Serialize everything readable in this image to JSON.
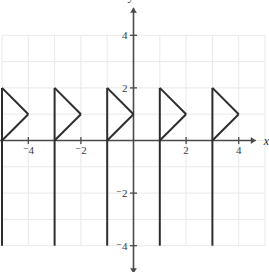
{
  "figure": {
    "kind": "coordinate-plane-graph",
    "background": "#ffffff",
    "grid_color": "#e9e9e9",
    "axis_color": "#4a4a4a",
    "curve_color": "#2e2e2e"
  },
  "axes": {
    "x_name": "x",
    "y_name": "y",
    "x_tick_labels": [
      "⁻4",
      "⁻2",
      "2",
      "4"
    ],
    "y_tick_labels": [
      "4",
      "2",
      "⁻2",
      "⁻4"
    ]
  },
  "chart_data": {
    "type": "line",
    "title": "",
    "xlabel": "x",
    "ylabel": "y",
    "xlim": [
      -5.85,
      4.65
    ],
    "ylim": [
      -5.05,
      5.05
    ],
    "grid": true,
    "legend": null,
    "x_ticks": [
      -4,
      -2,
      2,
      4
    ],
    "y_ticks": [
      4,
      2,
      -2,
      -4
    ],
    "x_tick_labels": [
      "⁻4",
      "⁻2",
      "2",
      "4"
    ],
    "y_tick_labels": [
      "4",
      "2",
      "⁻2",
      "⁻4"
    ],
    "period": 2,
    "period_starts": [
      -5,
      -3,
      -1,
      1,
      3
    ],
    "series": [
      {
        "name": "branch-1",
        "vertical": [
          [
            -5,
            2
          ],
          [
            -5,
            -4
          ]
        ],
        "upper_diagonal": [
          [
            -5,
            2
          ],
          [
            -4,
            1
          ]
        ],
        "lower_diagonal": [
          [
            -4,
            1
          ],
          [
            -5,
            0
          ]
        ]
      },
      {
        "name": "branch-2",
        "vertical": [
          [
            -3,
            2
          ],
          [
            -3,
            -4
          ]
        ],
        "upper_diagonal": [
          [
            -3,
            2
          ],
          [
            -2,
            1
          ]
        ],
        "lower_diagonal": [
          [
            -2,
            1
          ],
          [
            -3,
            0
          ]
        ]
      },
      {
        "name": "branch-3",
        "vertical": [
          [
            -1,
            2
          ],
          [
            -1,
            -4
          ]
        ],
        "upper_diagonal": [
          [
            -1,
            2
          ],
          [
            0,
            1
          ]
        ],
        "lower_diagonal": [
          [
            0,
            1
          ],
          [
            -1,
            0
          ]
        ]
      },
      {
        "name": "branch-4",
        "vertical": [
          [
            1,
            2
          ],
          [
            1,
            -4
          ]
        ],
        "upper_diagonal": [
          [
            1,
            2
          ],
          [
            2,
            1
          ]
        ],
        "lower_diagonal": [
          [
            2,
            1
          ],
          [
            1,
            0
          ]
        ]
      },
      {
        "name": "branch-5",
        "vertical": [
          [
            3,
            2
          ],
          [
            3,
            -4
          ]
        ],
        "upper_diagonal": [
          [
            3,
            2
          ],
          [
            4,
            1
          ]
        ],
        "lower_diagonal": [
          [
            4,
            1
          ],
          [
            3,
            0
          ]
        ]
      }
    ]
  }
}
